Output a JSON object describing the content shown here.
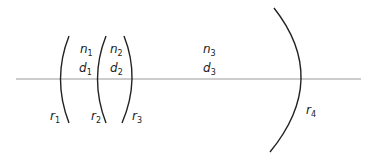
{
  "diagram": {
    "type": "optical-lens-system",
    "axis": {
      "color": "#9a9a9a"
    },
    "stroke_color": "#222222",
    "media": [
      {
        "n": {
          "base": "n",
          "sub": "1"
        },
        "d": {
          "base": "d",
          "sub": "1"
        }
      },
      {
        "n": {
          "base": "n",
          "sub": "2"
        },
        "d": {
          "base": "d",
          "sub": "2"
        }
      },
      {
        "n": {
          "base": "n",
          "sub": "3"
        },
        "d": {
          "base": "d",
          "sub": "3"
        }
      }
    ],
    "surfaces": [
      {
        "base": "r",
        "sub": "1"
      },
      {
        "base": "r",
        "sub": "2"
      },
      {
        "base": "r",
        "sub": "3"
      },
      {
        "base": "r",
        "sub": "4"
      }
    ]
  }
}
